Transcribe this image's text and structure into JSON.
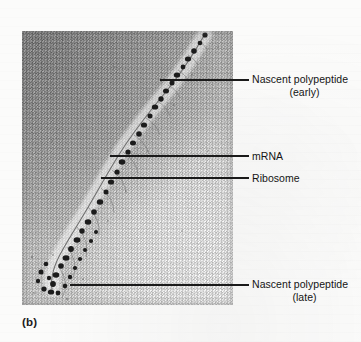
{
  "figure": {
    "panel_letter": "(b)",
    "micrograph": {
      "alt_name": "polysome-electron-micrograph",
      "description": "Electron micrograph of a polyribosome with ribosomes strung along an mRNA strand and nascent polypeptides of increasing length",
      "tone_dark": "#9d9d9d",
      "tone_light": "#f2f2f1",
      "ribosome_color": "#1c1c1c",
      "strand_color": "#4a4a4a"
    },
    "labels": [
      {
        "id": "nascent-polypeptide-early",
        "line1": "Nascent polypeptide",
        "line2": "(early)"
      },
      {
        "id": "mrna",
        "line1": "mRNA",
        "line2": ""
      },
      {
        "id": "ribosome",
        "line1": "Ribosome",
        "line2": ""
      },
      {
        "id": "nascent-polypeptide-late",
        "line1": "Nascent polypeptide",
        "line2": "(late)"
      }
    ],
    "leader_color": "#1a1a1a"
  }
}
